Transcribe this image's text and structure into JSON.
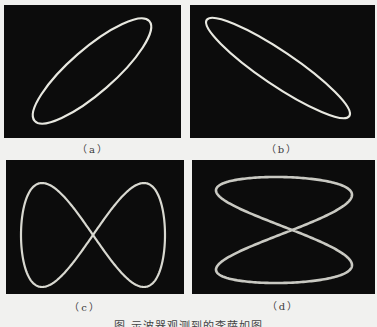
{
  "figure": {
    "panels": [
      {
        "id": "a",
        "label": "（a）",
        "shape": "ellipse",
        "description": "tilted ellipse rising to the right"
      },
      {
        "id": "b",
        "label": "（b）",
        "shape": "ellipse",
        "description": "tilted ellipse falling to the right"
      },
      {
        "id": "c",
        "label": "（c）",
        "shape": "lissajous",
        "description": "horizontal figure-eight"
      },
      {
        "id": "d",
        "label": "（d）",
        "shape": "lissajous",
        "description": "vertical figure-eight (hourglass)"
      }
    ],
    "caption": "图    示波器观测到的李萨如图",
    "colors": {
      "page_background": "#f1f1ef",
      "screen_background": "#0c0c0c",
      "trace": "#e8e8e0"
    }
  }
}
